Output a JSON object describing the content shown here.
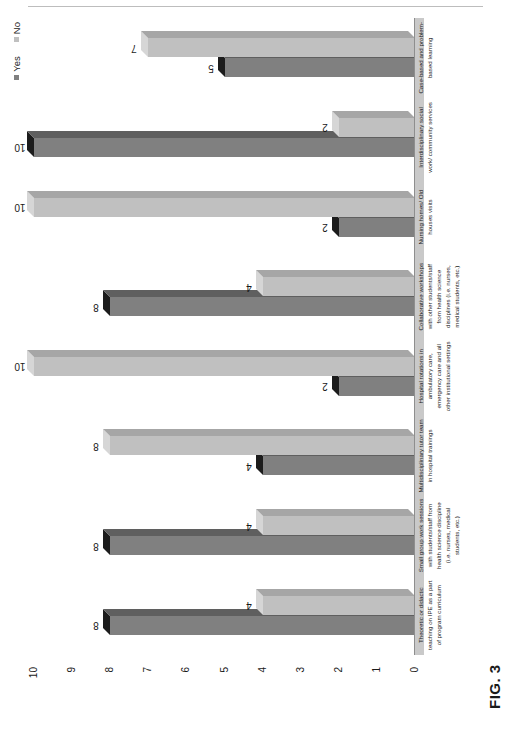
{
  "figure": {
    "caption": "FIG. 3"
  },
  "legend": {
    "position": "top-right",
    "items": [
      {
        "label": "Yes",
        "color": "#808080",
        "marker": "legend-swatch-yes"
      },
      {
        "label": "No",
        "color": "#c0c0c0",
        "marker": "legend-swatch-no"
      }
    ]
  },
  "axis": {
    "ticks": [
      "10",
      "9",
      "8",
      "7",
      "6",
      "5",
      "4",
      "3",
      "2",
      "1",
      "0"
    ]
  },
  "chart_data": {
    "type": "bar",
    "title": "FIG. 3",
    "xlabel": "",
    "ylabel": "",
    "ylim": [
      0,
      10
    ],
    "grid": false,
    "legend_position": "top-right",
    "orientation": "vertical-3d-rotated",
    "categories": [
      "Theoretic or didactic teaching on IPE as a part of program curriculum",
      "Small group work sessions with students/staff from health science discipline (i.e. nurses, medical students, etc.)",
      "Multidisciplinary tutor team in hospital trainings",
      "Hospital rotations in ambulatory care, emergency care and all other institutional settings",
      "Collaborative workshops with other students/staff from health science disciplines (i.e. nurses, medical students, etc.)",
      "Nursing homes/ Old houses visits",
      "Interdisciplinary social work/ community services",
      "Case-based and problem-based learning"
    ],
    "series": [
      {
        "name": "Yes",
        "color": "#808080",
        "values": [
          8,
          8,
          4,
          2,
          8,
          2,
          10,
          5
        ]
      },
      {
        "name": "No",
        "color": "#c0c0c0",
        "values": [
          4,
          4,
          8,
          10,
          4,
          10,
          2,
          7
        ]
      }
    ]
  }
}
